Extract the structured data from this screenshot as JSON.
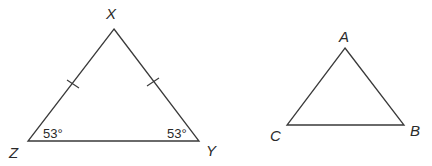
{
  "triangle_xyz": {
    "vertices": {
      "X": {
        "label": "X",
        "x": 114,
        "y": 29
      },
      "Y": {
        "label": "Y",
        "x": 199,
        "y": 141
      },
      "Z": {
        "label": "Z",
        "x": 28,
        "y": 141
      }
    },
    "angles": {
      "Z": "53°",
      "Y": "53°"
    },
    "congruent_sides": [
      "XZ",
      "XY"
    ]
  },
  "triangle_abc": {
    "vertices": {
      "A": {
        "label": "A",
        "x": 345,
        "y": 48
      },
      "B": {
        "label": "B",
        "x": 404,
        "y": 125
      },
      "C": {
        "label": "C",
        "x": 287,
        "y": 125
      }
    }
  },
  "colors": {
    "stroke": "#3a3a3a",
    "text": "#2a2a2a",
    "background": "#ffffff"
  }
}
